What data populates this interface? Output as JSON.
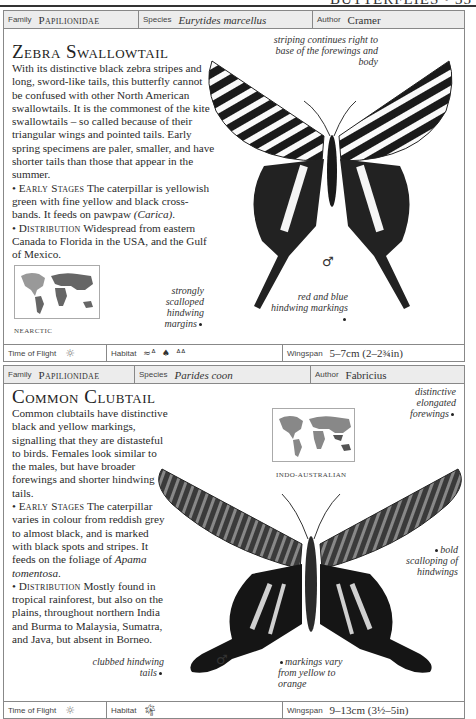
{
  "page": {
    "running_head": "BUTTERFLIES • 35"
  },
  "entries": [
    {
      "family_label": "Family",
      "family": "Papilionidae",
      "species_label": "Species",
      "species": "Eurytides marcellus",
      "author_label": "Author",
      "author": "Cramer",
      "common_name": "Zebra Swallowtail",
      "intro": "With its distinctive black zebra stripes and long, sword-like tails, this butterfly cannot be confused with other North American swallowtails. It is the commonest of the kite swallowtails – so called because of their triangular wings and pointed tails. Early spring specimens are paler, smaller, and have shorter tails than those that appear in the summer.",
      "early_stages_heading": "Early Stages",
      "early_stages_text_a": " The caterpillar is yellowish green with fine yellow and black cross-bands. It feeds on pawpaw ",
      "early_stages_italic": "(Carica)",
      "early_stages_text_b": ".",
      "distribution_heading": "Distribution",
      "distribution_text": " Widespread from eastern Canada to Florida in the USA, and the Gulf of Mexico.",
      "map_region": "NEARCTIC",
      "annotations": [
        "striping continues right to base of the forewings and body",
        "strongly scalloped hindwing margins",
        "red and blue hindwing markings"
      ],
      "sex_symbol": "♂",
      "time_of_flight_label": "Time of Flight",
      "time_of_flight_icon": "sun-icon",
      "habitat_label": "Habitat",
      "habitat_icons": [
        "wetland-icon",
        "tree-icon",
        "grassland-icon"
      ],
      "wingspan_label": "Wingspan",
      "wingspan": "5–7cm (2–2¾in)"
    },
    {
      "family_label": "Family",
      "family": "Papilionidae",
      "species_label": "Species",
      "species": "Parides coon",
      "author_label": "Author",
      "author": "Fabricius",
      "common_name": "Common Clubtail",
      "intro": "Common clubtails have distinctive black and yellow markings, signalling that they are distasteful to birds. Females look similar to the males, but have broader forewings and shorter hindwing tails.",
      "early_stages_heading": "Early Stages",
      "early_stages_text_a": " The caterpillar varies in colour from reddish grey to almost black, and is marked with black spots and stripes. It feeds on the foliage of ",
      "early_stages_italic": "Apama tomentosa",
      "early_stages_text_b": ".",
      "distribution_heading": "Distribution",
      "distribution_text": " Mostly found in tropical rainforest, but also on the plains, throughout northern India and Burma to Malaysia, Sumatra, and Java, but absent in Borneo.",
      "map_region": "INDO-AUSTRALIAN",
      "annotations": [
        "distinctive elongated forewings",
        "bold scalloping of hindwings",
        "clubbed hindwing tails",
        "markings vary from yellow to orange"
      ],
      "sex_symbol": "♂",
      "time_of_flight_label": "Time of Flight",
      "time_of_flight_icon": "sun-icon",
      "habitat_label": "Habitat",
      "habitat_icons": [
        "palm-tree-icon"
      ],
      "wingspan_label": "Wingspan",
      "wingspan": "9–13cm (3½–5in)"
    }
  ]
}
